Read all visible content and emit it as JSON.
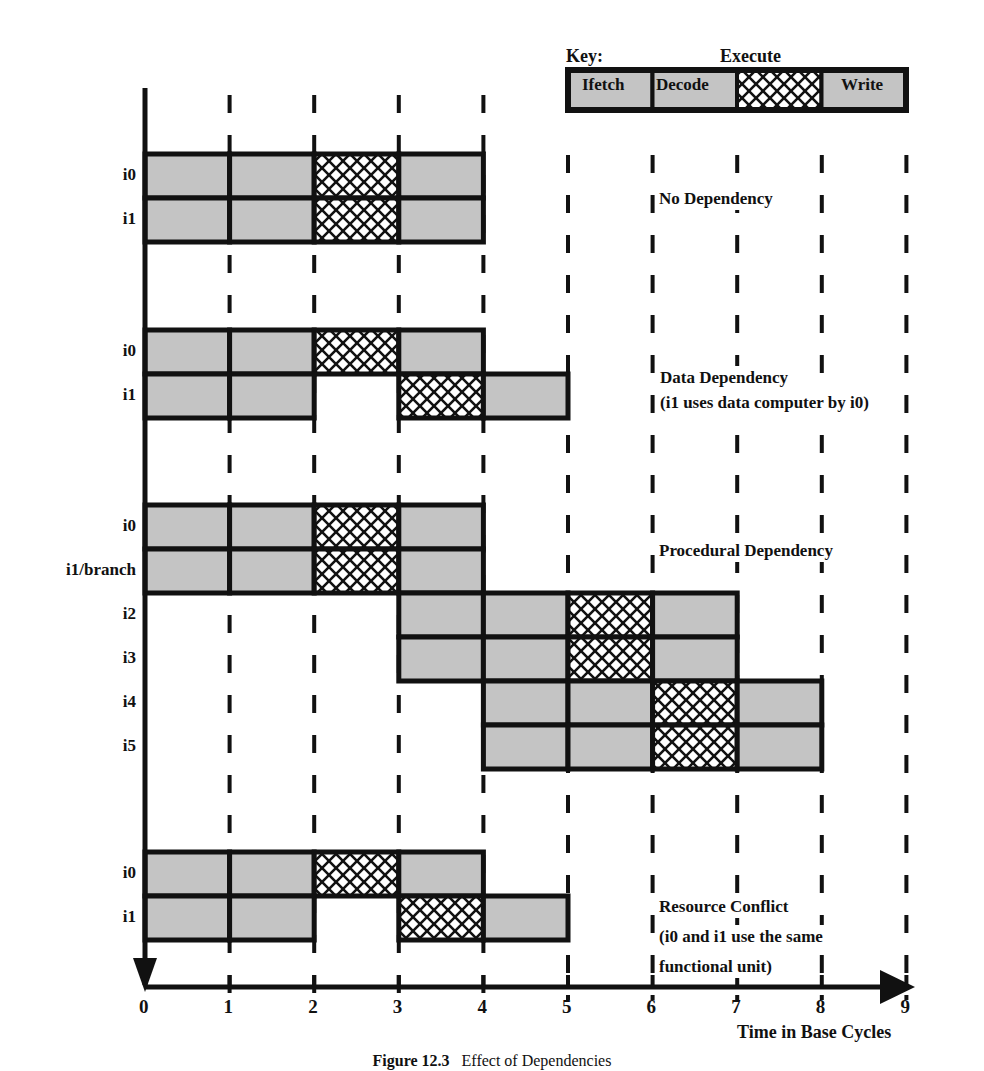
{
  "figure": {
    "caption_number": "Figure 12.3",
    "caption_title": "Effect of Dependencies",
    "x_axis_label": "Time in Base Cycles",
    "x_ticks": [
      "0",
      "1",
      "2",
      "3",
      "4",
      "5",
      "6",
      "7",
      "8",
      "9"
    ]
  },
  "key": {
    "title": "Key:",
    "stages": [
      {
        "name": "Ifetch",
        "fill": "gray"
      },
      {
        "name": "Decode",
        "fill": "gray"
      },
      {
        "name": "Execute",
        "fill": "crosshatch"
      },
      {
        "name": "Write",
        "fill": "gray"
      }
    ]
  },
  "colors": {
    "stage_fill": "#c4c4c4",
    "outline": "#111111",
    "hatch": "#111111",
    "background": "#ffffff"
  },
  "scenarios": [
    {
      "id": "no-dependency",
      "title": "No Dependency",
      "subtitle": "",
      "instructions": [
        {
          "label": "i0",
          "stages": [
            [
              0,
              "Ifetch"
            ],
            [
              1,
              "Decode"
            ],
            [
              2,
              "Execute"
            ],
            [
              3,
              "Write"
            ]
          ]
        },
        {
          "label": "i1",
          "stages": [
            [
              0,
              "Ifetch"
            ],
            [
              1,
              "Decode"
            ],
            [
              2,
              "Execute"
            ],
            [
              3,
              "Write"
            ]
          ]
        }
      ]
    },
    {
      "id": "data-dependency",
      "title": "Data Dependency",
      "subtitle": "(i1 uses data computer by i0)",
      "instructions": [
        {
          "label": "i0",
          "stages": [
            [
              0,
              "Ifetch"
            ],
            [
              1,
              "Decode"
            ],
            [
              2,
              "Execute"
            ],
            [
              3,
              "Write"
            ]
          ]
        },
        {
          "label": "i1",
          "stages": [
            [
              0,
              "Ifetch"
            ],
            [
              1,
              "Decode"
            ],
            [
              3,
              "Execute"
            ],
            [
              4,
              "Write"
            ]
          ]
        }
      ]
    },
    {
      "id": "procedural-dependency",
      "title": "Procedural Dependency",
      "subtitle": "",
      "instructions": [
        {
          "label": "i0",
          "stages": [
            [
              0,
              "Ifetch"
            ],
            [
              1,
              "Decode"
            ],
            [
              2,
              "Execute"
            ],
            [
              3,
              "Write"
            ]
          ]
        },
        {
          "label": "i1/branch",
          "stages": [
            [
              0,
              "Ifetch"
            ],
            [
              1,
              "Decode"
            ],
            [
              2,
              "Execute"
            ],
            [
              3,
              "Write"
            ]
          ]
        },
        {
          "label": "i2",
          "stages": [
            [
              3,
              "Ifetch"
            ],
            [
              4,
              "Decode"
            ],
            [
              5,
              "Execute"
            ],
            [
              6,
              "Write"
            ]
          ]
        },
        {
          "label": "i3",
          "stages": [
            [
              3,
              "Ifetch"
            ],
            [
              4,
              "Decode"
            ],
            [
              5,
              "Execute"
            ],
            [
              6,
              "Write"
            ]
          ]
        },
        {
          "label": "i4",
          "stages": [
            [
              4,
              "Ifetch"
            ],
            [
              5,
              "Decode"
            ],
            [
              6,
              "Execute"
            ],
            [
              7,
              "Write"
            ]
          ]
        },
        {
          "label": "i5",
          "stages": [
            [
              4,
              "Ifetch"
            ],
            [
              5,
              "Decode"
            ],
            [
              6,
              "Execute"
            ],
            [
              7,
              "Write"
            ]
          ]
        }
      ]
    },
    {
      "id": "resource-conflict",
      "title": "Resource Conflict",
      "subtitle": "(i0 and i1 use the same",
      "subtitle2": "functional unit)",
      "instructions": [
        {
          "label": "i0",
          "stages": [
            [
              0,
              "Ifetch"
            ],
            [
              1,
              "Decode"
            ],
            [
              2,
              "Execute"
            ],
            [
              3,
              "Write"
            ]
          ]
        },
        {
          "label": "i1",
          "stages": [
            [
              0,
              "Ifetch"
            ],
            [
              1,
              "Decode"
            ],
            [
              3,
              "Execute"
            ],
            [
              4,
              "Write"
            ]
          ]
        }
      ]
    }
  ],
  "chart_data": {
    "type": "table",
    "title": "Effect of Dependencies",
    "xlabel": "Time in Base Cycles",
    "xlim": [
      0,
      9
    ],
    "legend": [
      "Ifetch",
      "Decode",
      "Execute",
      "Write"
    ],
    "series": [
      {
        "name": "No Dependency / i0",
        "Ifetch": 0,
        "Decode": 1,
        "Execute": 2,
        "Write": 3
      },
      {
        "name": "No Dependency / i1",
        "Ifetch": 0,
        "Decode": 1,
        "Execute": 2,
        "Write": 3
      },
      {
        "name": "Data Dependency / i0",
        "Ifetch": 0,
        "Decode": 1,
        "Execute": 2,
        "Write": 3
      },
      {
        "name": "Data Dependency / i1",
        "Ifetch": 0,
        "Decode": 1,
        "Execute": 3,
        "Write": 4
      },
      {
        "name": "Procedural Dependency / i0",
        "Ifetch": 0,
        "Decode": 1,
        "Execute": 2,
        "Write": 3
      },
      {
        "name": "Procedural Dependency / i1/branch",
        "Ifetch": 0,
        "Decode": 1,
        "Execute": 2,
        "Write": 3
      },
      {
        "name": "Procedural Dependency / i2",
        "Ifetch": 3,
        "Decode": 4,
        "Execute": 5,
        "Write": 6
      },
      {
        "name": "Procedural Dependency / i3",
        "Ifetch": 3,
        "Decode": 4,
        "Execute": 5,
        "Write": 6
      },
      {
        "name": "Procedural Dependency / i4",
        "Ifetch": 4,
        "Decode": 5,
        "Execute": 6,
        "Write": 7
      },
      {
        "name": "Procedural Dependency / i5",
        "Ifetch": 4,
        "Decode": 5,
        "Execute": 6,
        "Write": 7
      },
      {
        "name": "Resource Conflict / i0",
        "Ifetch": 0,
        "Decode": 1,
        "Execute": 2,
        "Write": 3
      },
      {
        "name": "Resource Conflict / i1",
        "Ifetch": 0,
        "Decode": 1,
        "Execute": 3,
        "Write": 4
      }
    ]
  }
}
